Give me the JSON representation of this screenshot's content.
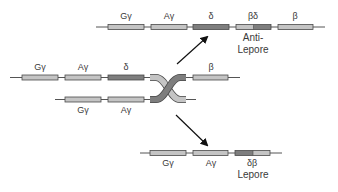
{
  "colors": {
    "light_gene": "#c4c4c4",
    "dark_gene": "#7e7e7e",
    "line": "#555555",
    "stroke": "#4a4a4a",
    "text": "#3a3a3a"
  },
  "top_product": {
    "genes": [
      {
        "label": "Gγ",
        "x": 108,
        "w": 36,
        "type": "light"
      },
      {
        "label": "Aγ",
        "x": 151,
        "w": 36,
        "type": "light"
      },
      {
        "label": "δ",
        "x": 193,
        "w": 36,
        "type": "dark"
      },
      {
        "label": "βδ",
        "x": 236,
        "w": 35,
        "type": "hybrid-beta-delta"
      },
      {
        "label": "β",
        "x": 278,
        "w": 35,
        "type": "light"
      }
    ],
    "caption_line1": "Anti-",
    "caption_line2": "Lepore"
  },
  "parent_chromosome_upper": {
    "genes": [
      {
        "label": "Gγ",
        "type": "light"
      },
      {
        "label": "Aγ",
        "type": "light"
      },
      {
        "label": "δ",
        "type": "dark"
      },
      {
        "label": "β",
        "type": "light"
      }
    ]
  },
  "parent_chromosome_lower": {
    "genes": [
      {
        "label": "Gγ",
        "type": "light"
      },
      {
        "label": "Aγ",
        "type": "light"
      }
    ]
  },
  "bottom_product": {
    "genes": [
      {
        "label": "Gγ",
        "type": "light"
      },
      {
        "label": "Aγ",
        "type": "light"
      },
      {
        "label": "δβ",
        "type": "hybrid-delta-beta"
      }
    ],
    "caption": "Lepore"
  }
}
